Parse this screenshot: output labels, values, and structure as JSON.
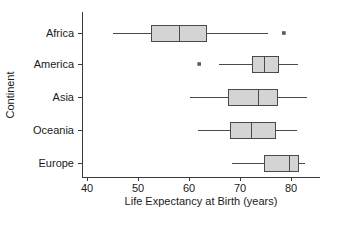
{
  "chart_data": {
    "type": "box",
    "title": "",
    "xlabel": "Life Expectancy at Birth (years)",
    "ylabel": "Continent",
    "xlim": [
      38,
      84.5
    ],
    "xticks": [
      40,
      50,
      60,
      70,
      80
    ],
    "xtick_labels": [
      "40",
      "50",
      "60",
      "70",
      "80"
    ],
    "grid": false,
    "legend": "none",
    "orientation": "horizontal",
    "categories": [
      "Africa",
      "America",
      "Asia",
      "Oceania",
      "Europe"
    ],
    "boxes": [
      {
        "category": "Africa",
        "whisker_low": 45.1,
        "q1": 52.7,
        "median": 58.2,
        "q3": 63.5,
        "whisker_high": 75.5,
        "outliers": [
          78.6
        ]
      },
      {
        "category": "America",
        "whisker_low": 65.9,
        "q1": 72.4,
        "median": 74.9,
        "q3": 77.5,
        "whisker_high": 81.4,
        "outliers": [
          62.0
        ]
      },
      {
        "category": "Asia",
        "whisker_low": 60.2,
        "q1": 67.8,
        "median": 73.7,
        "q3": 77.3,
        "whisker_high": 83.1,
        "outliers": []
      },
      {
        "category": "Oceania",
        "whisker_low": 61.8,
        "q1": 68.2,
        "median": 72.2,
        "q3": 76.9,
        "whisker_high": 81.2,
        "outliers": []
      },
      {
        "category": "Europe",
        "whisker_low": 68.4,
        "q1": 74.9,
        "median": 79.8,
        "q3": 81.4,
        "whisker_high": 82.7,
        "outliers": []
      }
    ],
    "colors": {
      "box_fill": "#d4d4d4",
      "box_stroke": "#4a4a4a",
      "axis": "#3a3a3a",
      "text": "#1a1a1a",
      "outlier": "#5a5a5a",
      "background": "#ffffff"
    }
  },
  "layout": {
    "plot_left": 82,
    "plot_right": 320,
    "plot_top": 12,
    "plot_bottom": 177,
    "x_value_at_left_px": 87,
    "x_value_at_right_px": 291,
    "x_value_left": 40,
    "x_value_right": 80,
    "row_centers_y": [
      33,
      64,
      97,
      130,
      163
    ],
    "box_half_height": 8,
    "tick_length": 4,
    "xlabel_y": 205,
    "ylabel_x": 14,
    "ylabel_y": 95
  }
}
